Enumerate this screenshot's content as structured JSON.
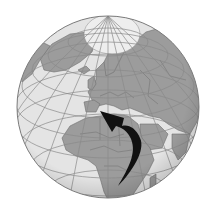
{
  "map": {
    "projection": "orthographic",
    "view_center": {
      "lat": 35,
      "lon": 20
    },
    "visible_regions": [
      "Arctic",
      "Greenland",
      "Europe",
      "North Africa",
      "Middle East",
      "East Africa",
      "Southern Africa",
      "Russia",
      "Central Asia"
    ],
    "colors": {
      "background": "#ffffff",
      "ocean": "#e4e4e4",
      "land": "#9c9c9c",
      "ice": "#eeeeee",
      "borders": "#6e6e6e",
      "graticule": "#8a8a8a",
      "arrow": "#111111"
    },
    "arrow": {
      "meaning": "migration route",
      "from": "Southern/Eastern Africa",
      "to": "Mediterranean / Southern Europe",
      "direction": "northward, curving"
    }
  }
}
